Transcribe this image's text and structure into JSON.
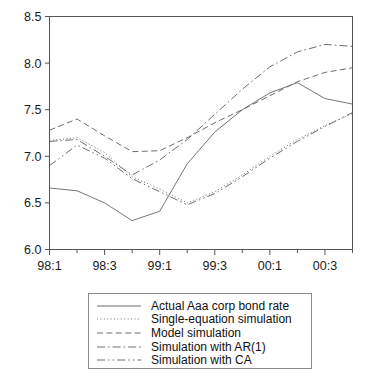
{
  "chart_data": {
    "type": "line",
    "title": "",
    "xlabel": "",
    "ylabel": "",
    "ylim": [
      6.0,
      8.5
    ],
    "yticks": [
      "6.0",
      "6.5",
      "7.0",
      "7.5",
      "8.0",
      "8.5"
    ],
    "ytick_values": [
      6.0,
      6.5,
      7.0,
      7.5,
      8.0,
      8.5
    ],
    "grid": false,
    "legend_position": "below-plot",
    "x": [
      "98:1",
      "98:2",
      "98:3",
      "98:4",
      "99:1",
      "99:2",
      "99:3",
      "99:4",
      "00:1",
      "00:2",
      "00:3",
      "00:4"
    ],
    "xticks_labeled": [
      "98:1",
      "98:3",
      "99:1",
      "99:3",
      "00:1",
      "00:3"
    ],
    "xtick_label_indices": [
      0,
      2,
      4,
      6,
      8,
      10
    ],
    "series": [
      {
        "name": "Actual Aaa corp bond rate",
        "style": "solid",
        "values": [
          6.66,
          6.63,
          6.5,
          6.31,
          6.41,
          6.92,
          7.26,
          7.5,
          7.68,
          7.79,
          7.62,
          7.56
        ]
      },
      {
        "name": "Single-equation simulation",
        "style": "dotted",
        "values": [
          7.17,
          7.2,
          7.04,
          6.78,
          6.65,
          6.5,
          6.62,
          6.8,
          7.0,
          7.18,
          7.33,
          7.46
        ]
      },
      {
        "name": "Model simulation",
        "style": "dashed",
        "values": [
          7.28,
          7.4,
          7.22,
          7.05,
          7.06,
          7.2,
          7.36,
          7.5,
          7.65,
          7.8,
          7.9,
          7.95
        ]
      },
      {
        "name": "Simulation with AR(1)",
        "style": "dash-dot",
        "values": [
          7.16,
          7.18,
          7.0,
          6.8,
          6.96,
          7.18,
          7.45,
          7.72,
          7.96,
          8.12,
          8.2,
          8.18
        ]
      },
      {
        "name": "Simulation with CA",
        "style": "dash-dot-dot",
        "values": [
          6.9,
          7.12,
          6.98,
          6.76,
          6.62,
          6.48,
          6.6,
          6.78,
          6.98,
          7.16,
          7.32,
          7.47
        ]
      }
    ]
  },
  "legend": {
    "entries": [
      {
        "label": "Actual Aaa corp bond rate",
        "style": "solid"
      },
      {
        "label": "Single-equation simulation",
        "style": "dotted"
      },
      {
        "label": "Model simulation",
        "style": "dashed"
      },
      {
        "label": "Simulation with AR(1)",
        "style": "dash-dot"
      },
      {
        "label": "Simulation with CA",
        "style": "dash-dot-dot"
      }
    ]
  },
  "colors": {
    "line": "#6e6e6e",
    "axis": "#555555",
    "text": "#111111",
    "legend_border": "#8a8a8a",
    "background": "#ffffff"
  }
}
